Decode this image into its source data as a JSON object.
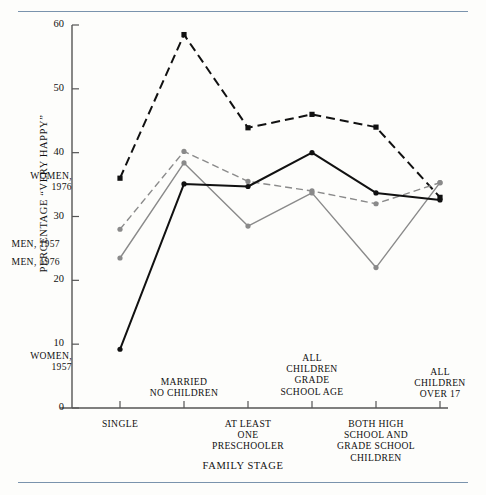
{
  "figure": {
    "background": "#fdfdfb",
    "rule_color": "#7a93ad"
  },
  "chart_data": {
    "type": "line",
    "title": "",
    "xlabel": "FAMILY STAGE",
    "ylabel": "PERCENTAGE “VERY HAPPY”",
    "ylim": [
      0,
      60
    ],
    "yticks": [
      "0",
      "10",
      "20",
      "30",
      "40",
      "50",
      "60"
    ],
    "grid": false,
    "legend_position": "inline-left",
    "categories": [
      "SINGLE",
      "MARRIED\nNO CHILDREN",
      "AT LEAST\nONE\nPRESCHOOLER",
      "ALL\nCHILDREN\nGRADE\nSCHOOL AGE",
      "BOTH HIGH\nSCHOOL AND\nGRADE SCHOOL\nCHILDREN",
      "ALL\nCHILDREN\nOVER 17"
    ],
    "series": [
      {
        "name": "WOMEN,\n1976",
        "values": [
          36.0,
          58.5,
          43.9,
          46.0,
          44.0,
          33.0
        ],
        "color": "#111111",
        "style": "dashed",
        "marker": "square"
      },
      {
        "name": "MEN, 1957",
        "values": [
          28.0,
          40.2,
          35.5,
          34.0,
          32.0,
          35.3
        ],
        "color": "#8a8a8a",
        "style": "dashed",
        "marker": "circle"
      },
      {
        "name": "MEN, 1976",
        "values": [
          23.5,
          38.4,
          28.5,
          33.7,
          22.0,
          35.3
        ],
        "color": "#8a8a8a",
        "style": "solid",
        "marker": "circle"
      },
      {
        "name": "WOMEN,\n1957",
        "values": [
          9.2,
          35.1,
          34.7,
          40.0,
          33.7,
          32.6
        ],
        "color": "#111111",
        "style": "solid",
        "marker": "circle"
      }
    ],
    "series_labels": [
      {
        "text": "WOMEN,\n1976",
        "x": 72,
        "y": 170
      },
      {
        "text": "MEN, 1957",
        "x": 60,
        "y": 238
      },
      {
        "text": "MEN, 1976",
        "x": 60,
        "y": 256
      },
      {
        "text": "WOMEN,\n1957",
        "x": 72,
        "y": 350
      }
    ]
  }
}
